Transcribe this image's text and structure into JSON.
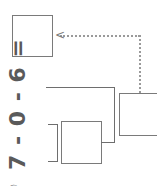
{
  "expression": {
    "text": "7 - 0 - 6 ="
  },
  "circled_marker": {
    "text": "⑥"
  },
  "boxes": [
    {
      "name": "answer-box",
      "value": ""
    },
    {
      "name": "intermediate-box",
      "value": ""
    },
    {
      "name": "step-box",
      "value": ""
    }
  ],
  "arrow": {
    "glyph": "<"
  }
}
